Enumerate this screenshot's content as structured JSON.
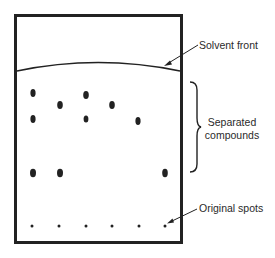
{
  "diagram": {
    "type": "thin-layer-chromatography-plate",
    "colors": {
      "ink": "#222222",
      "background": "#ffffff"
    },
    "plate": {
      "x": 14,
      "y": 14,
      "width": 168,
      "height": 229,
      "border_width": 3
    },
    "solvent_front": {
      "left_y": 71,
      "peak_y": 61,
      "right_y": 71
    },
    "original_spots": {
      "y": 226,
      "x": [
        32,
        59,
        86,
        112,
        139,
        165
      ],
      "radius": 1.5
    },
    "separated_spots": [
      {
        "x": 33,
        "y": 93
      },
      {
        "x": 60,
        "y": 105
      },
      {
        "x": 86,
        "y": 95
      },
      {
        "x": 112,
        "y": 105
      },
      {
        "x": 33,
        "y": 119
      },
      {
        "x": 86,
        "y": 119
      },
      {
        "x": 138,
        "y": 121
      },
      {
        "x": 33,
        "y": 173
      },
      {
        "x": 60,
        "y": 173
      },
      {
        "x": 165,
        "y": 173
      }
    ],
    "labels": {
      "solvent_front": "Solvent front",
      "separated_line1": "Separated",
      "separated_line2": "compounds",
      "original_spots": "Original spots"
    },
    "brace": {
      "x": 190,
      "top_y": 82,
      "bottom_y": 172
    }
  }
}
